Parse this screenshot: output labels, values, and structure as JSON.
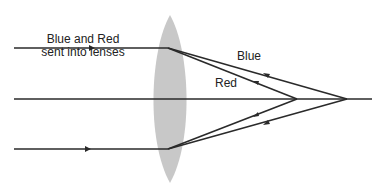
{
  "diagram": {
    "title_line1": "Blue and Red",
    "title_line2": "sent into lenses",
    "blue_label": "Blue",
    "red_label": "Red",
    "colors": {
      "lens": "#c8c8c8",
      "ray": "#2a2a2a",
      "background": "#ffffff"
    }
  }
}
